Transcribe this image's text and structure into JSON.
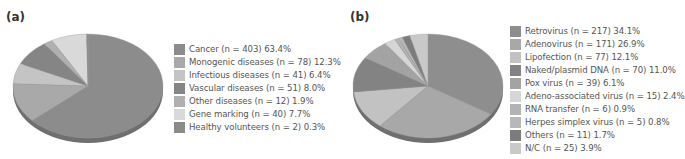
{
  "chart_data": [
    {
      "type": "pie",
      "panel": "(a)",
      "title": "",
      "categories": [
        "Cancer",
        "Monogenic diseases",
        "Infectious diseases",
        "Vascular diseases",
        "Other diseases",
        "Gene marking",
        "Healthy volunteers"
      ],
      "n": [
        403,
        78,
        41,
        51,
        12,
        40,
        2
      ],
      "values": [
        63.4,
        12.3,
        6.4,
        8.0,
        1.9,
        7.7,
        0.3
      ],
      "legend_position": "right",
      "legend": [
        {
          "label": "Cancer (n = 403) 63.4%",
          "color": "#8c8c8c"
        },
        {
          "label": "Monogenic diseases (n = 78) 12.3%",
          "color": "#a9a9a9"
        },
        {
          "label": "Infectious diseases (n = 41) 6.4%",
          "color": "#c4c4c4"
        },
        {
          "label": "Vascular diseases (n = 51) 8.0%",
          "color": "#858585"
        },
        {
          "label": "Other diseases (n = 12) 1.9%",
          "color": "#b0b0b0"
        },
        {
          "label": "Gene marking (n = 40) 7.7%",
          "color": "#d9d9d9"
        },
        {
          "label": "Healthy volunteers (n = 2) 0.3%",
          "color": "#8a8a8a"
        }
      ]
    },
    {
      "type": "pie",
      "panel": "(b)",
      "title": "",
      "categories": [
        "Retrovirus",
        "Adenovirus",
        "Lipofection",
        "Naked/plasmid DNA",
        "Pox virus",
        "Adeno-associated virus",
        "RNA transfer",
        "Herpes simplex virus",
        "Others",
        "N/C"
      ],
      "n": [
        217,
        171,
        77,
        70,
        39,
        15,
        6,
        5,
        11,
        25
      ],
      "values": [
        34.1,
        26.9,
        12.1,
        11.0,
        6.1,
        2.4,
        0.9,
        0.8,
        1.7,
        3.9
      ],
      "legend_position": "right",
      "legend": [
        {
          "label": "Retrovirus (n = 217) 34.1%",
          "color": "#8e8e8e"
        },
        {
          "label": "Adenovirus (n = 171) 26.9%",
          "color": "#a8a8a8"
        },
        {
          "label": "Lipofection (n = 77) 12.1%",
          "color": "#c2c2c2"
        },
        {
          "label": "Naked/plasmid DNA (n = 70) 11.0%",
          "color": "#838383"
        },
        {
          "label": "Pox virus (n = 39) 6.1%",
          "color": "#a3a3a3"
        },
        {
          "label": "Adeno-associated virus (n = 15) 2.4%",
          "color": "#d6d6d6"
        },
        {
          "label": "RNA transfer (n = 6) 0.9%",
          "color": "#b3b3b3"
        },
        {
          "label": "Herpes simplex virus (n = 5) 0.8%",
          "color": "#b8b8b8"
        },
        {
          "label": "Others (n = 11) 1.7%",
          "color": "#7c7c7c"
        },
        {
          "label": "N/C (n = 25) 3.9%",
          "color": "#c9c9c9"
        }
      ]
    }
  ]
}
